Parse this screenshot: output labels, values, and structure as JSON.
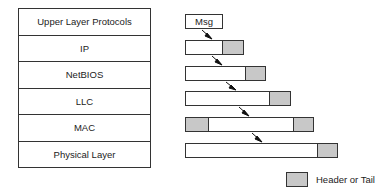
{
  "stack": {
    "layers": [
      {
        "label": "Upper Layer Protocols"
      },
      {
        "label": "IP"
      },
      {
        "label": "NetBIOS"
      },
      {
        "label": "LLC"
      },
      {
        "label": "MAC"
      },
      {
        "label": "Physical Layer"
      }
    ]
  },
  "packets": {
    "msg_label": "Msg"
  },
  "legend": {
    "label": "Header or Tail",
    "color": "#c8c8c8"
  }
}
